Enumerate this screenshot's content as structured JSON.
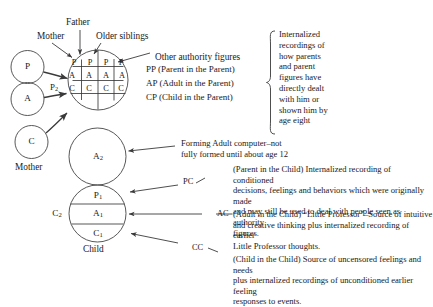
{
  "diagram": {
    "colors": {
      "stroke": "#3a3a3a",
      "text": "#1a1a1a",
      "background": "#ffffff"
    },
    "source_circles": [
      {
        "id": "source-p",
        "label": "P"
      },
      {
        "id": "source-a",
        "label": "A"
      },
      {
        "id": "source-c",
        "label": "C"
      }
    ],
    "source_group_label": "Mother",
    "parent_influence_label": "P",
    "parent_influence_sub": "2",
    "top_callouts": [
      {
        "id": "father",
        "label": "Father"
      },
      {
        "id": "mother",
        "label": "Mother"
      },
      {
        "id": "older-siblings",
        "label": "Older siblings"
      },
      {
        "id": "other-authority-figures",
        "label": "Other authority figures"
      }
    ],
    "parent_grid": {
      "rows": [
        {
          "key": "P",
          "cells": [
            "P",
            "P",
            "P",
            "P"
          ]
        },
        {
          "key": "A",
          "cells": [
            "A",
            "A",
            "A",
            "A"
          ]
        },
        {
          "key": "C",
          "cells": [
            "C",
            "C",
            "C",
            "C"
          ]
        }
      ]
    },
    "parent_row_legend": [
      "PP (Parent in the Parent)",
      "AP (Adult in the Parent)",
      "CP (Child in the Parent)"
    ],
    "brace_note": [
      "Internalized",
      "recordings of",
      "how parents",
      "and parent",
      "figures have",
      "directly dealt",
      "with him or",
      "shown him by",
      "age eight"
    ],
    "adult_circle": {
      "label": "A",
      "sub": "2"
    },
    "adult_note": [
      "Forming Adult computer–not",
      "fully formed until about age 12"
    ],
    "child_circle": {
      "outer_label": "C",
      "outer_sub": "2",
      "caption": "Child",
      "segments": [
        {
          "label": "P",
          "sub": "1",
          "tag": "PC"
        },
        {
          "label": "A",
          "sub": "1",
          "tag": "AC"
        },
        {
          "label": "C",
          "sub": "1",
          "tag": "CC"
        }
      ]
    },
    "child_notes": [
      {
        "tag": "PC",
        "lines": [
          "(Parent in the Child) Internalized recording of conditioned",
          "decisions, feelings and behaviors which were originally made",
          "and may still be used to deal with people seen as authority",
          "figures."
        ]
      },
      {
        "tag": "AC",
        "lines": [
          "(Adult in the Child)  “Little Professor”–Source of intuitive",
          "and creative thinking plus internalized recording of earlier",
          "Little Professor thoughts."
        ]
      },
      {
        "tag": "CC",
        "lines": [
          "(Child in the Child) Source of uncensored feelings and needs",
          "plus internalized recordings of unconditioned earlier feeling",
          "responses to events."
        ]
      }
    ]
  }
}
